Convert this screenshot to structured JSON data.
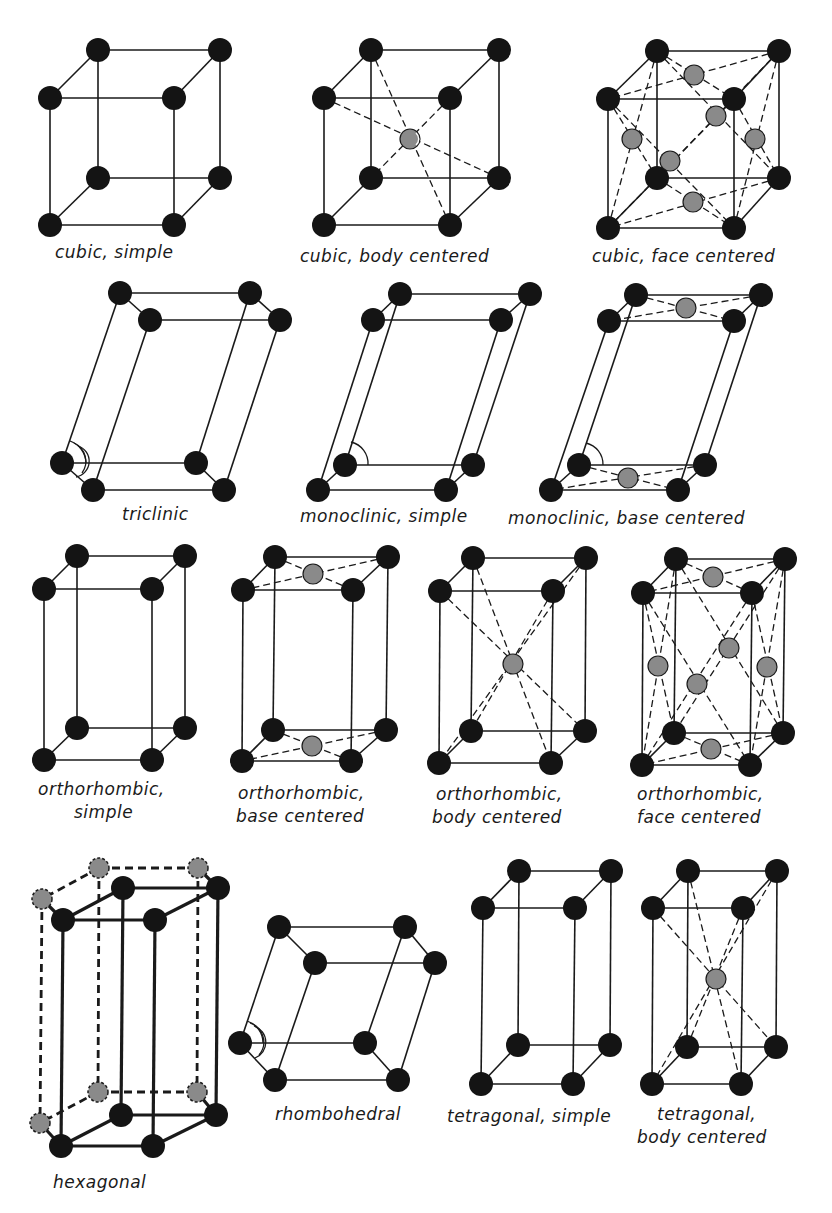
{
  "figure": {
    "colors": {
      "corner_atom": "#141414",
      "centered_atom": "#8a8a8a",
      "line": "#1a1a1a",
      "background": "#ffffff"
    },
    "lattices": [
      {
        "id": "cubic-simple",
        "label": "cubic, simple",
        "system": "cubic",
        "centering": "simple"
      },
      {
        "id": "cubic-body-centered",
        "label": "cubic, body centered",
        "system": "cubic",
        "centering": "body centered"
      },
      {
        "id": "cubic-face-centered",
        "label": "cubic, face centered",
        "system": "cubic",
        "centering": "face centered"
      },
      {
        "id": "triclinic",
        "label": "triclinic",
        "system": "triclinic",
        "centering": "simple"
      },
      {
        "id": "monoclinic-simple",
        "label": "monoclinic, simple",
        "system": "monoclinic",
        "centering": "simple"
      },
      {
        "id": "monoclinic-base-centered",
        "label": "monoclinic, base centered",
        "system": "monoclinic",
        "centering": "base centered"
      },
      {
        "id": "orthorhombic-simple",
        "label_line1": "orthorhombic,",
        "label_line2": "simple",
        "system": "orthorhombic",
        "centering": "simple"
      },
      {
        "id": "orthorhombic-base-centered",
        "label_line1": "orthorhombic,",
        "label_line2": "base centered",
        "system": "orthorhombic",
        "centering": "base centered"
      },
      {
        "id": "orthorhombic-body-centered",
        "label_line1": "orthorhombic,",
        "label_line2": "body centered",
        "system": "orthorhombic",
        "centering": "body centered"
      },
      {
        "id": "orthorhombic-face-centered",
        "label_line1": "orthorhombic,",
        "label_line2": "face centered",
        "system": "orthorhombic",
        "centering": "face centered"
      },
      {
        "id": "hexagonal",
        "label": "hexagonal",
        "system": "hexagonal",
        "centering": "simple"
      },
      {
        "id": "rhombohedral",
        "label": "rhombohedral",
        "system": "rhombohedral",
        "centering": "simple"
      },
      {
        "id": "tetragonal-simple",
        "label": "tetragonal, simple",
        "system": "tetragonal",
        "centering": "simple"
      },
      {
        "id": "tetragonal-body-centered",
        "label_line1": "tetragonal,",
        "label_line2": "body centered",
        "system": "tetragonal",
        "centering": "body centered"
      }
    ]
  }
}
